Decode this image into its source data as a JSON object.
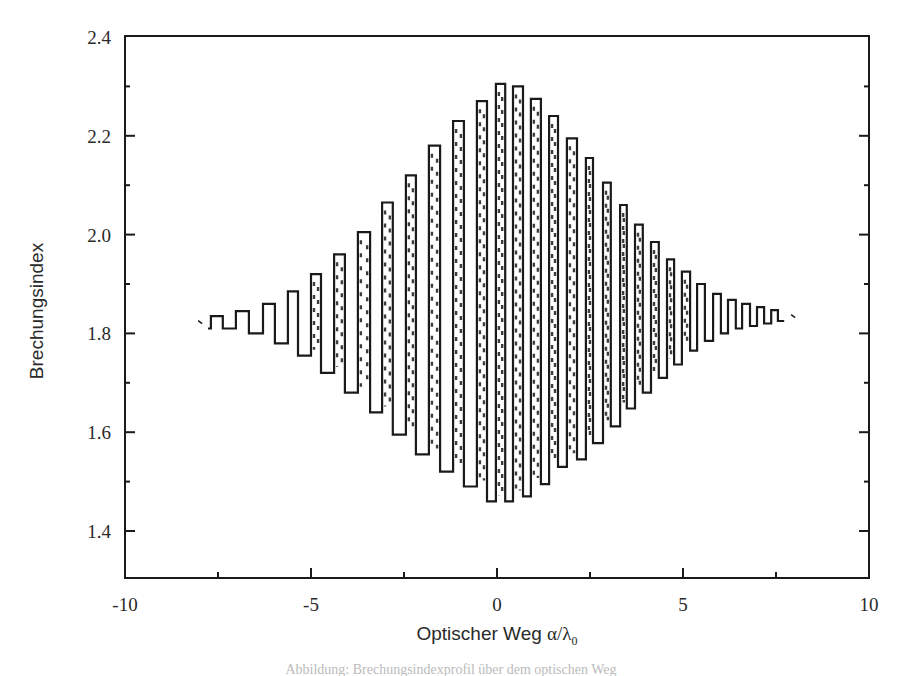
{
  "chart_data": {
    "type": "line",
    "title": "",
    "xlabel": "Optischer Weg α/λ₀",
    "xlabel_main": "Optischer Weg ",
    "xlabel_symbol": "α/λ",
    "xlabel_subscript": "0",
    "ylabel": "Brechungsindex",
    "xlim": [
      -10,
      10
    ],
    "ylim": [
      1.305,
      2.4
    ],
    "grid": false,
    "legend": null,
    "x_ticks": [
      -10,
      -5,
      0,
      5,
      10
    ],
    "x_tick_labels": [
      "-10",
      "-5",
      "0",
      "5",
      "10"
    ],
    "x_minor_ticks": [
      -7.5,
      -2.5,
      2.5,
      7.5
    ],
    "y_ticks": [
      1.4,
      1.6,
      1.8,
      2.0,
      2.2,
      2.4
    ],
    "y_tick_labels": [
      "1.4",
      "1.6",
      "1.8",
      "2.0",
      "2.2",
      "2.4"
    ],
    "y_minor_ticks": [
      1.5,
      1.7,
      1.9,
      2.1,
      2.3
    ],
    "series": [
      {
        "name": "Brechungsindex-Profil",
        "style": "step",
        "segments": [
          [
            -7.77,
            -7.69,
            1.81
          ],
          [
            -7.69,
            -7.37,
            1.835
          ],
          [
            -7.37,
            -7.02,
            1.81
          ],
          [
            -7.02,
            -6.67,
            1.845
          ],
          [
            -6.67,
            -6.29,
            1.8
          ],
          [
            -6.29,
            -5.97,
            1.86
          ],
          [
            -5.97,
            -5.62,
            1.78
          ],
          [
            -5.62,
            -5.35,
            1.885
          ],
          [
            -5.35,
            -5.0,
            1.755
          ],
          [
            -5.0,
            -4.73,
            1.92
          ],
          [
            -4.73,
            -4.38,
            1.72
          ],
          [
            -4.38,
            -4.09,
            1.96
          ],
          [
            -4.09,
            -3.74,
            1.68
          ],
          [
            -3.74,
            -3.41,
            2.005
          ],
          [
            -3.41,
            -3.09,
            1.64
          ],
          [
            -3.09,
            -2.8,
            2.065
          ],
          [
            -2.8,
            -2.45,
            1.595
          ],
          [
            -2.45,
            -2.18,
            2.12
          ],
          [
            -2.18,
            -1.83,
            1.555
          ],
          [
            -1.83,
            -1.53,
            2.18
          ],
          [
            -1.53,
            -1.18,
            1.52
          ],
          [
            -1.18,
            -0.89,
            2.23
          ],
          [
            -0.89,
            -0.54,
            1.49
          ],
          [
            -0.54,
            -0.27,
            2.27
          ],
          [
            -0.27,
            -0.03,
            1.46
          ],
          [
            -0.03,
            0.22,
            2.305
          ],
          [
            0.22,
            0.43,
            1.46
          ],
          [
            0.43,
            0.7,
            2.3
          ],
          [
            0.7,
            0.91,
            1.47
          ],
          [
            0.91,
            1.18,
            2.275
          ],
          [
            1.18,
            1.4,
            1.495
          ],
          [
            1.4,
            1.64,
            2.24
          ],
          [
            1.64,
            1.88,
            1.53
          ],
          [
            1.88,
            2.15,
            2.195
          ],
          [
            2.15,
            2.39,
            1.545
          ],
          [
            2.39,
            2.58,
            2.155
          ],
          [
            2.58,
            2.85,
            1.578
          ],
          [
            2.85,
            3.06,
            2.105
          ],
          [
            3.06,
            3.31,
            1.612
          ],
          [
            3.31,
            3.49,
            2.06
          ],
          [
            3.49,
            3.71,
            1.648
          ],
          [
            3.71,
            3.92,
            2.02
          ],
          [
            3.92,
            4.14,
            1.68
          ],
          [
            4.14,
            4.35,
            1.985
          ],
          [
            4.35,
            4.57,
            1.71
          ],
          [
            4.57,
            4.76,
            1.95
          ],
          [
            4.76,
            4.97,
            1.737
          ],
          [
            4.97,
            5.19,
            1.925
          ],
          [
            5.19,
            5.38,
            1.765
          ],
          [
            5.38,
            5.59,
            1.9
          ],
          [
            5.59,
            5.81,
            1.785
          ],
          [
            5.81,
            6.02,
            1.88
          ],
          [
            6.02,
            6.21,
            1.8
          ],
          [
            6.21,
            6.42,
            1.868
          ],
          [
            6.42,
            6.59,
            1.81
          ],
          [
            6.59,
            6.8,
            1.86
          ],
          [
            6.8,
            6.99,
            1.815
          ],
          [
            6.99,
            7.18,
            1.853
          ],
          [
            7.18,
            7.37,
            1.82
          ],
          [
            7.37,
            7.55,
            1.847
          ],
          [
            7.55,
            7.72,
            1.825
          ]
        ],
        "end_markers": [
          [
            -7.98,
            1.822
          ],
          [
            7.96,
            1.834
          ]
        ]
      }
    ]
  },
  "caption": {
    "text": "Abbildung: Brechungsindexprofil über dem optischen Weg"
  }
}
